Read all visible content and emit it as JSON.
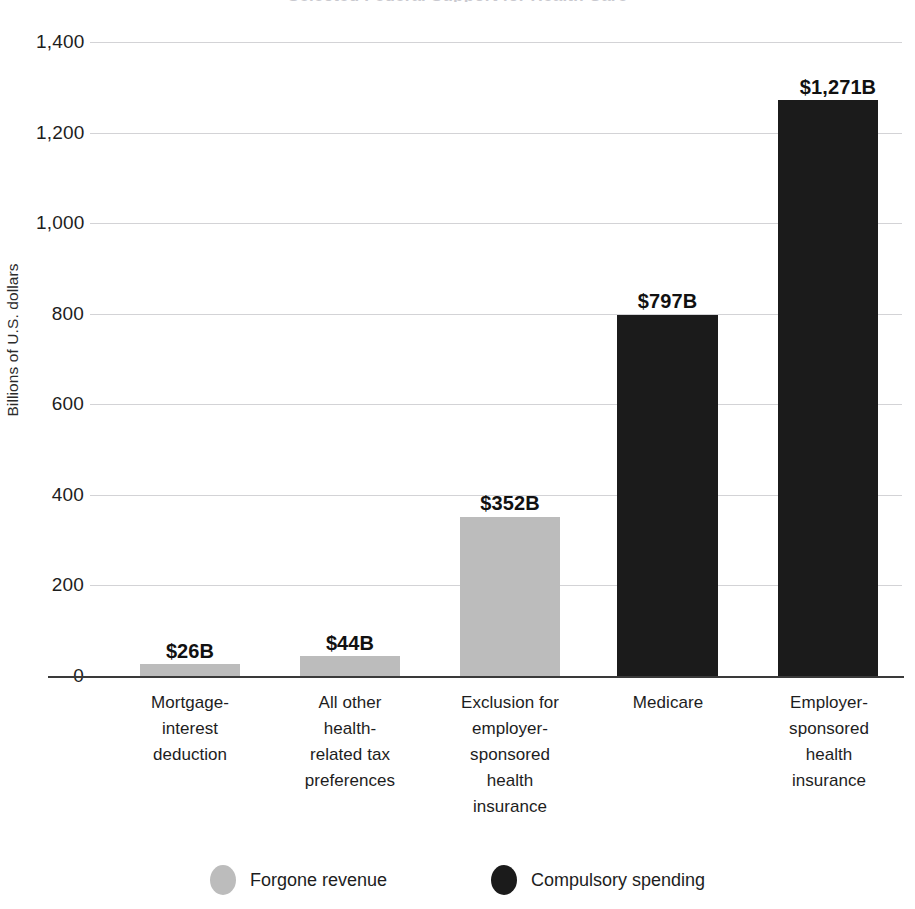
{
  "chart_data": {
    "type": "bar",
    "title": "",
    "xlabel": "",
    "ylabel": "Billions of U.S. dollars",
    "ylim": [
      0,
      1400
    ],
    "ytick_step": 200,
    "ytick_labels": [
      "1,400",
      "1,200",
      "1,000",
      "800",
      "600",
      "400",
      "200",
      "0"
    ],
    "ytick_values": [
      1400,
      1200,
      1000,
      800,
      600,
      400,
      200,
      0
    ],
    "grid": true,
    "legend_position": "bottom",
    "categories": [
      "Mortgage-interest deduction",
      "All other health-related tax preferences",
      "Exclusion for employer-sponsored health insurance",
      "Medicare",
      "Employer-sponsored health insurance"
    ],
    "category_lines": [
      [
        "Mortgage-",
        "interest",
        "deduction"
      ],
      [
        "All other",
        "health-",
        "related tax",
        "preferences"
      ],
      [
        "Exclusion for",
        "employer-",
        "sponsored",
        "health",
        "insurance"
      ],
      [
        "Medicare"
      ],
      [
        "Employer-",
        "sponsored",
        "health",
        "insurance"
      ]
    ],
    "values": [
      26,
      44,
      352,
      797,
      1271
    ],
    "value_labels": [
      "$26B",
      "$44B",
      "$352B",
      "$797B",
      "$1,271B"
    ],
    "series_of_bar": [
      "Forgone revenue",
      "Forgone revenue",
      "Forgone revenue",
      "Compulsory spending",
      "Compulsory spending"
    ],
    "legend": [
      {
        "name": "Forgone revenue",
        "color": "#bcbcbc",
        "marker": "circle"
      },
      {
        "name": "Compulsory spending",
        "color": "#1b1b1b",
        "marker": "circle"
      }
    ],
    "colors": {
      "forgone_revenue": "#bcbcbc",
      "compulsory_spending": "#1b1b1b",
      "gridline": "#d3d3d6",
      "axis": "#3a3a3a",
      "text": "#1d1d1d"
    }
  },
  "axis": {
    "y_title": "Billions of U.S. dollars"
  },
  "ticks": [
    {
      "label": "1,400"
    },
    {
      "label": "1,200"
    },
    {
      "label": "1,000"
    },
    {
      "label": "800"
    },
    {
      "label": "600"
    },
    {
      "label": "400"
    },
    {
      "label": "200"
    },
    {
      "label": "0"
    }
  ],
  "bars": [
    {
      "value_label": "$26B",
      "cat_l0": "Mortgage-",
      "cat_l1": "interest",
      "cat_l2": "deduction",
      "cat_l3": "",
      "cat_l4": ""
    },
    {
      "value_label": "$44B",
      "cat_l0": "All other",
      "cat_l1": "health-",
      "cat_l2": "related tax",
      "cat_l3": "preferences",
      "cat_l4": ""
    },
    {
      "value_label": "$352B",
      "cat_l0": "Exclusion for",
      "cat_l1": "employer-",
      "cat_l2": "sponsored",
      "cat_l3": "health",
      "cat_l4": "insurance"
    },
    {
      "value_label": "$797B",
      "cat_l0": "Medicare",
      "cat_l1": "",
      "cat_l2": "",
      "cat_l3": "",
      "cat_l4": ""
    },
    {
      "value_label": "$1,271B",
      "cat_l0": "Employer-",
      "cat_l1": "sponsored",
      "cat_l2": "health",
      "cat_l3": "insurance",
      "cat_l4": ""
    }
  ],
  "legend": {
    "forgone_label": "Forgone revenue",
    "compulsory_label": "Compulsory spending"
  },
  "title_remnant": "Selected Federal Support for Health Care"
}
